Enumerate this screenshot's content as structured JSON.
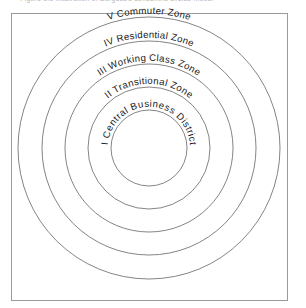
{
  "figure": {
    "caption_top": "Figure 1.1    Illustration of Burgess's concentric circles model",
    "caption_visible": "partially clipped at image top edge",
    "frame": {
      "x": 11,
      "y": 13,
      "width": 276,
      "height": 287,
      "stroke_color": "#9a9a9a"
    },
    "center": {
      "x": 149,
      "y": 148
    },
    "ring_stroke_color": "#6e6e6e",
    "background_color": "#ffffff",
    "label_color": "#1a1a1a"
  },
  "chart_data": {
    "type": "diagram",
    "diagram_kind": "concentric-circles",
    "title": "Figure 1.1    Illustration of Burgess's concentric circles model",
    "center": {
      "x": 149,
      "y": 148
    },
    "zones": [
      {
        "index": 5,
        "numeral": "V",
        "name": "Commuter Zone",
        "label": "V Commuter Zone",
        "radius": 131,
        "label_radius": 131
      },
      {
        "index": 4,
        "numeral": "IV",
        "name": "Residential Zone",
        "label": "IV Residential Zone",
        "radius": 107,
        "label_radius": 107
      },
      {
        "index": 3,
        "numeral": "III",
        "name": "Working Class Zone",
        "label": "III Working Class Zone",
        "radius": 84,
        "label_radius": 84
      },
      {
        "index": 2,
        "numeral": "II",
        "name": "Transitional Zone",
        "label": "II Transitional Zone",
        "radius": 61,
        "label_radius": 61
      },
      {
        "index": 1,
        "numeral": "I",
        "name": "Central Business District",
        "label": "I Central Business District",
        "radius": 38,
        "label_radius": 38
      }
    ],
    "ring_count": 5,
    "grid": false,
    "legend": "none",
    "xlabel": "",
    "ylabel": ""
  }
}
